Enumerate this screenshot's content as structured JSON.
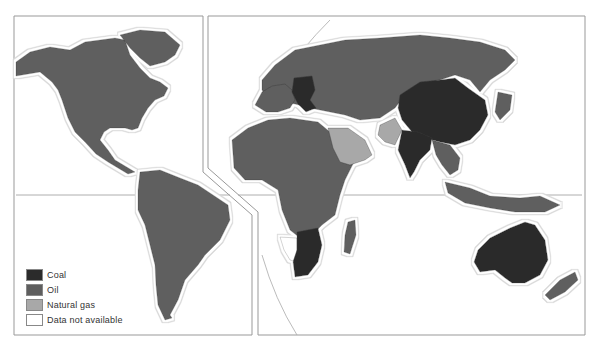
{
  "map": {
    "title": "",
    "categories": {
      "coal": {
        "label": "Coal",
        "color": "#2b2b2b"
      },
      "oil": {
        "label": "Oil",
        "color": "#5e5e5e"
      },
      "gas": {
        "label": "Natural gas",
        "color": "#a8a8a8"
      },
      "na": {
        "label": "Data not available",
        "color": "#ffffff"
      }
    },
    "legend": [
      {
        "key": "coal",
        "label": "Coal",
        "color": "#2b2b2b"
      },
      {
        "key": "oil",
        "label": "Oil",
        "color": "#5e5e5e"
      },
      {
        "key": "gas",
        "label": "Natural gas",
        "color": "#a8a8a8"
      },
      {
        "key": "na",
        "label": "Data not available",
        "color": "#ffffff"
      }
    ],
    "regions": [
      {
        "name": "North America",
        "category": "oil"
      },
      {
        "name": "Greenland",
        "category": "oil"
      },
      {
        "name": "South America",
        "category": "oil"
      },
      {
        "name": "Western Europe",
        "category": "oil"
      },
      {
        "name": "Central/Eastern Europe",
        "category": "coal"
      },
      {
        "name": "Russia/Central Asia",
        "category": "oil"
      },
      {
        "name": "Arabian Peninsula",
        "category": "gas"
      },
      {
        "name": "Iran/Pakistan region",
        "category": "gas"
      },
      {
        "name": "Africa",
        "category": "oil"
      },
      {
        "name": "Southern Africa",
        "category": "coal"
      },
      {
        "name": "Namibia",
        "category": "na"
      },
      {
        "name": "China/Mongolia",
        "category": "coal"
      },
      {
        "name": "India",
        "category": "coal"
      },
      {
        "name": "Southeast Asia",
        "category": "oil"
      },
      {
        "name": "Japan/Korea",
        "category": "oil"
      },
      {
        "name": "Indonesia",
        "category": "oil"
      },
      {
        "name": "Australia",
        "category": "coal"
      },
      {
        "name": "New Zealand",
        "category": "oil"
      },
      {
        "name": "Madagascar",
        "category": "oil"
      }
    ]
  }
}
